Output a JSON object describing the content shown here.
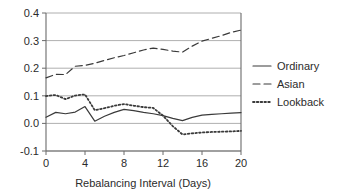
{
  "chart_data": {
    "type": "line",
    "title": "",
    "xlabel": "Rebalancing Interval (Days)",
    "ylabel": "",
    "xlim": [
      0,
      20
    ],
    "ylim": [
      -0.1,
      0.4
    ],
    "grid": true,
    "legend_position": "right",
    "x_ticks": [
      "0",
      "4",
      "8",
      "12",
      "16",
      "20"
    ],
    "x_tick_values": [
      0,
      4,
      8,
      12,
      16,
      20
    ],
    "y_ticks": [
      "0.4",
      "0.3",
      "0.2",
      "0.1",
      "0.0",
      "-0.1"
    ],
    "y_tick_values": [
      0.4,
      0.3,
      0.2,
      0.1,
      0.0,
      -0.1
    ],
    "x": [
      0,
      1,
      2,
      3,
      4,
      5,
      6,
      7,
      8,
      9,
      10,
      11,
      12,
      13,
      14,
      15,
      16,
      17,
      18,
      19,
      20
    ],
    "series": [
      {
        "name": "Ordinary",
        "style": "solid",
        "color": "#3a3a3a",
        "values": [
          0.022,
          0.04,
          0.035,
          0.041,
          0.061,
          0.008,
          0.026,
          0.04,
          0.051,
          0.046,
          0.04,
          0.035,
          0.028,
          0.018,
          0.01,
          0.022,
          0.03,
          0.033,
          0.035,
          0.037,
          0.039
        ]
      },
      {
        "name": "Asian",
        "style": "dashed",
        "color": "#3a3a3a",
        "values": [
          0.165,
          0.178,
          0.177,
          0.207,
          0.21,
          0.218,
          0.228,
          0.238,
          0.246,
          0.256,
          0.266,
          0.273,
          0.268,
          0.262,
          0.258,
          0.28,
          0.298,
          0.308,
          0.318,
          0.33,
          0.338
        ]
      },
      {
        "name": "Lookback",
        "style": "dotted",
        "color": "#3a3a3a",
        "values": [
          0.099,
          0.103,
          0.088,
          0.101,
          0.105,
          0.048,
          0.055,
          0.064,
          0.07,
          0.064,
          0.059,
          0.056,
          0.028,
          -0.01,
          -0.04,
          -0.036,
          -0.033,
          -0.031,
          -0.03,
          -0.029,
          -0.027
        ]
      }
    ],
    "legend": [
      {
        "label": "Ordinary",
        "style": "solid"
      },
      {
        "label": "Asian",
        "style": "dashed"
      },
      {
        "label": "Lookback",
        "style": "dotted"
      }
    ]
  }
}
